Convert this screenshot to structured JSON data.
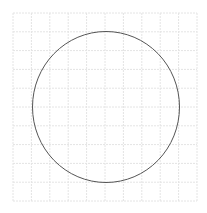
{
  "diagram": {
    "type": "circle-on-grid",
    "grid": {
      "x0": 13,
      "y0": 13,
      "x1": 197,
      "y1": 201,
      "columns": 10,
      "rows": 10,
      "color": "#e4e4e4",
      "dash": "2,1"
    },
    "circle": {
      "cx": 106,
      "cy": 107,
      "rx": 73.5,
      "ry": 75.5,
      "stroke": "#555555",
      "stroke_width": 1
    }
  }
}
